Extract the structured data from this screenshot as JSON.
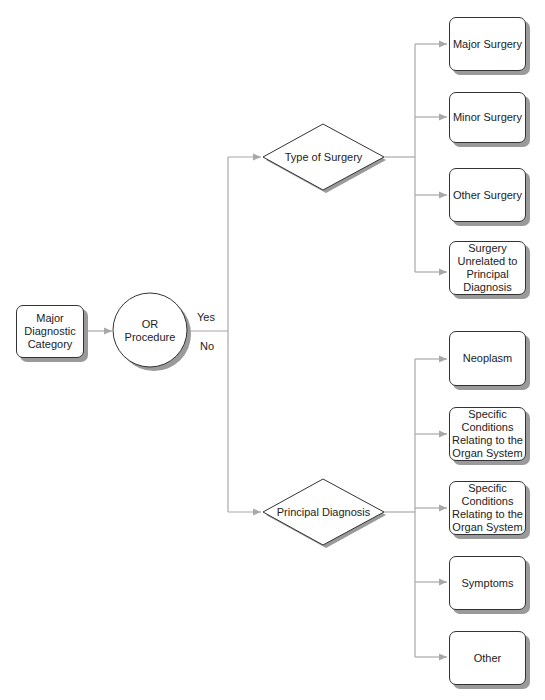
{
  "start": {
    "label": "Major\nDiagnostic\nCategory"
  },
  "decision_circle": {
    "label": "OR\nProcedure"
  },
  "branches": {
    "yes": "Yes",
    "no": "No"
  },
  "diamond_top": {
    "label": "Type of Surgery"
  },
  "diamond_bottom": {
    "label": "Principal Diagnosis"
  },
  "surgery_outcomes": [
    {
      "label": "Major Surgery"
    },
    {
      "label": "Minor Surgery"
    },
    {
      "label": "Other Surgery"
    },
    {
      "label": "Surgery\nUnrelated to\nPrincipal\nDiagnosis"
    }
  ],
  "diagnosis_outcomes": [
    {
      "label": "Neoplasm"
    },
    {
      "label": "Specific\nConditions\nRelating to the\nOrgan System"
    },
    {
      "label": "Specific\nConditions\nRelating to the\nOrgan System"
    },
    {
      "label": "Symptoms"
    },
    {
      "label": "Other"
    }
  ],
  "colors": {
    "line": "#9e9e9e",
    "border": "#333333",
    "shadow": "#9a9a9a"
  }
}
